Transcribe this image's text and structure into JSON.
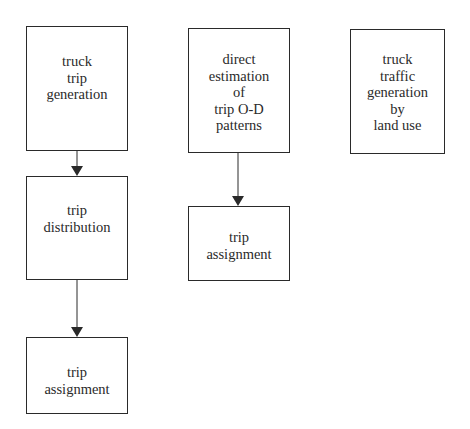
{
  "diagram": {
    "colors": {
      "stroke": "#2a2a2a",
      "text": "#2a2a2a",
      "background": "#ffffff"
    },
    "boxes": [
      {
        "id": "truck-trip-generation",
        "lines": [
          "truck",
          "trip",
          "generation"
        ],
        "x": 26,
        "y": 26,
        "w": 102,
        "h": 125,
        "pad_top": 26
      },
      {
        "id": "trip-distribution",
        "lines": [
          "trip",
          "distribution"
        ],
        "x": 26,
        "y": 176,
        "w": 102,
        "h": 104,
        "pad_top": 25
      },
      {
        "id": "trip-assignment-left",
        "lines": [
          "trip",
          "assignment"
        ],
        "x": 26,
        "y": 337,
        "w": 102,
        "h": 77,
        "pad_top": 26
      },
      {
        "id": "direct-estimation-od",
        "lines": [
          "direct",
          "estimation",
          "of",
          "trip O-D",
          "patterns"
        ],
        "x": 188,
        "y": 28,
        "w": 102,
        "h": 125,
        "pad_top": 22
      },
      {
        "id": "trip-assignment-middle",
        "lines": [
          "trip",
          "assignment"
        ],
        "x": 188,
        "y": 206,
        "w": 102,
        "h": 75,
        "pad_top": 22
      },
      {
        "id": "truck-traffic-generation-land-use",
        "lines": [
          "truck",
          "traffic",
          "generation",
          "by",
          "land use"
        ],
        "x": 350,
        "y": 29,
        "w": 95,
        "h": 125,
        "pad_top": 21
      }
    ],
    "arrows": [
      {
        "from": "truck-trip-generation",
        "to": "trip-distribution",
        "x": 77,
        "y1": 151,
        "y2": 176
      },
      {
        "from": "trip-distribution",
        "to": "trip-assignment-left",
        "x": 77,
        "y1": 280,
        "y2": 337
      },
      {
        "from": "direct-estimation-od",
        "to": "trip-assignment-middle",
        "x": 238,
        "y1": 153,
        "y2": 206
      }
    ]
  }
}
